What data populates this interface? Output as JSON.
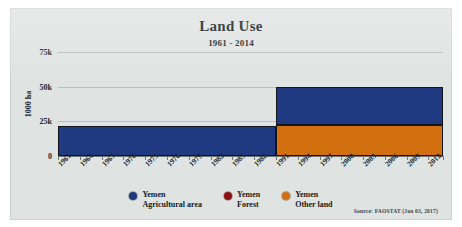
{
  "chart_data": {
    "type": "area",
    "title": "Land Use",
    "subtitle": "1961 - 2014",
    "xlabel": "",
    "ylabel": "1000 ha",
    "ylim": [
      0,
      75000
    ],
    "yticks": [
      0,
      25000,
      50000,
      75000
    ],
    "ytick_labels": [
      "0",
      "25k",
      "50k",
      "75k"
    ],
    "grid": true,
    "legend_position": "bottom-center",
    "stacked": true,
    "x_start": 1961,
    "x_end": 2014,
    "xtick_labels": [
      "1961",
      "1964",
      "1967",
      "1970",
      "1973",
      "1976",
      "1979",
      "1982",
      "1985",
      "1988",
      "1991",
      "1994",
      "1997",
      "2000",
      "2003",
      "2006",
      "2009",
      "2012"
    ],
    "categories": [
      1961,
      1964,
      1967,
      1970,
      1973,
      1976,
      1979,
      1982,
      1985,
      1988,
      1991,
      1994,
      1997,
      2000,
      2003,
      2006,
      2009,
      2012,
      2014
    ],
    "series": [
      {
        "name": "Yemen Other land",
        "color": "#d2700f",
        "stack_order": 1,
        "values": [
          0,
          0,
          0,
          0,
          0,
          0,
          0,
          0,
          0,
          0,
          22000,
          22000,
          22000,
          22000,
          22000,
          22000,
          22000,
          22000,
          22000
        ]
      },
      {
        "name": "Yemen Forest",
        "color": "#8f1010",
        "stack_order": 2,
        "values": [
          0,
          0,
          0,
          0,
          0,
          0,
          0,
          0,
          0,
          0,
          0,
          0,
          0,
          0,
          0,
          0,
          0,
          0,
          0
        ]
      },
      {
        "name": "Yemen Agricultural area",
        "color": "#1f3a80",
        "stack_order": 3,
        "values": [
          21500,
          21500,
          21500,
          21500,
          21500,
          21500,
          21500,
          21500,
          21500,
          21500,
          28000,
          28000,
          28000,
          28000,
          28000,
          28000,
          28000,
          28000,
          28000
        ]
      }
    ],
    "blocks": [
      {
        "name": "agricultural-area-1961-1991",
        "series": "Yemen Agricultural area",
        "x0": 1961,
        "x1": 1991,
        "y0": 0,
        "y1": 21500,
        "color": "#1f3a80"
      },
      {
        "name": "other-land-1991-2014",
        "series": "Yemen Other land",
        "x0": 1991,
        "x1": 2014,
        "y0": 0,
        "y1": 22000,
        "color": "#d2700f"
      },
      {
        "name": "agricultural-area-1991-2014",
        "series": "Yemen Agricultural area",
        "x0": 1991,
        "x1": 2014,
        "y0": 22000,
        "y1": 50000,
        "color": "#1f3a80"
      }
    ],
    "annotations": []
  },
  "legend": {
    "items": [
      {
        "marker_color": "#1f3a80",
        "line1": "Yemen",
        "line2": "Agricultural area"
      },
      {
        "marker_color": "#8f1010",
        "line1": "Yemen",
        "line2": "Forest"
      },
      {
        "marker_color": "#d2700f",
        "line1": "Yemen",
        "line2": "Other land"
      }
    ]
  },
  "footer": {
    "source": "Source: FAOSTAT (Jan 03, 2017)"
  },
  "colors": {
    "panel_background": "#dfe3e2",
    "agricultural": "#1f3a80",
    "forest": "#8f1010",
    "other_land": "#d2700f",
    "gridline": "#b9bfbe",
    "axis": "#6f7674"
  }
}
